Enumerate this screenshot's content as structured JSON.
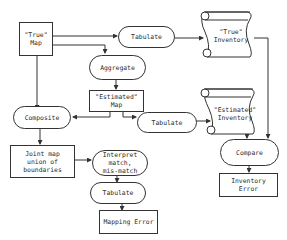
{
  "diagram": {
    "nodes": {
      "true_map": "\"True\"\nMap",
      "tabulate_top": "Tabulate",
      "true_inventory": "\"True\"\nInventory",
      "aggregate": "Aggregate",
      "estimated_map": "\"Estimated\"\nMap",
      "composite": "Composite",
      "tabulate_mid": "Tabulate",
      "estimated_inventory": "\"Estimated\"\nInventory",
      "joint_map": "Joint map\nunion of\nboundaries",
      "interpret": "Interpret\nmatch,\nmis-match",
      "compare": "Compare",
      "tabulate_bottom": "Tabulate",
      "inventory_error": "Inventory\nError",
      "mapping_error": "Mapping Error"
    },
    "edges": [
      {
        "from": "true_map",
        "to": "tabulate_top"
      },
      {
        "from": "true_map",
        "to": "aggregate"
      },
      {
        "from": "true_map",
        "to": "composite"
      },
      {
        "from": "tabulate_top",
        "to": "true_inventory"
      },
      {
        "from": "true_inventory",
        "to": "compare"
      },
      {
        "from": "aggregate",
        "to": "estimated_map"
      },
      {
        "from": "estimated_map",
        "to": "composite"
      },
      {
        "from": "estimated_map",
        "to": "tabulate_mid"
      },
      {
        "from": "tabulate_mid",
        "to": "estimated_inventory"
      },
      {
        "from": "estimated_inventory",
        "to": "compare"
      },
      {
        "from": "composite",
        "to": "joint_map"
      },
      {
        "from": "joint_map",
        "to": "interpret"
      },
      {
        "from": "interpret",
        "to": "tabulate_bottom"
      },
      {
        "from": "tabulate_bottom",
        "to": "mapping_error"
      },
      {
        "from": "compare",
        "to": "inventory_error"
      }
    ],
    "colors": {
      "line": "#333333",
      "background": "#ffffff",
      "text": "#2a2a2a"
    }
  }
}
